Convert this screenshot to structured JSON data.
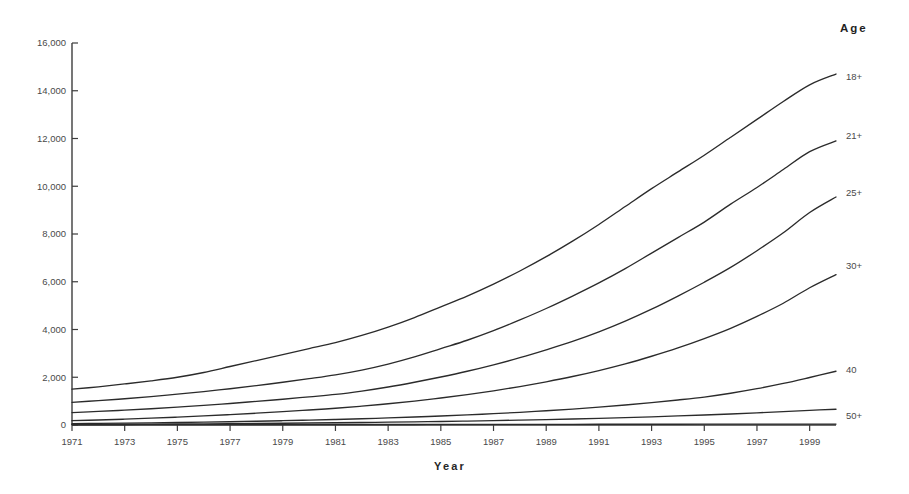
{
  "chart_data": {
    "type": "line",
    "title": "",
    "xlabel": "Year",
    "ylabel": "",
    "legend_title": "Age",
    "legend_position": "right-end-of-line",
    "grid": false,
    "xlim": [
      1971,
      2000
    ],
    "ylim": [
      0,
      16000
    ],
    "yticks": [
      0,
      2000,
      4000,
      6000,
      8000,
      10000,
      12000,
      14000,
      16000
    ],
    "ytick_labels": [
      "0",
      "2,000",
      "4,000",
      "6,000",
      "8,000",
      "10,000",
      "12,000",
      "14,000",
      "16,000"
    ],
    "xticks": [
      1971,
      1973,
      1975,
      1977,
      1979,
      1981,
      1983,
      1985,
      1987,
      1989,
      1991,
      1993,
      1995,
      1997,
      1999
    ],
    "xtick_labels": [
      "1971",
      "1973",
      "1975",
      "1977",
      "1979",
      "1981",
      "1983",
      "1985",
      "1987",
      "1989",
      "1991",
      "1993",
      "1995",
      "1997",
      "1999"
    ],
    "x": [
      1971,
      1972,
      1973,
      1974,
      1975,
      1976,
      1977,
      1978,
      1979,
      1980,
      1981,
      1982,
      1983,
      1984,
      1985,
      1986,
      1987,
      1988,
      1989,
      1990,
      1991,
      1992,
      1993,
      1994,
      1995,
      1996,
      1997,
      1998,
      1999,
      2000
    ],
    "series": [
      {
        "name": "18+",
        "label": "18+",
        "color": "#2b2b2b",
        "values": [
          1500,
          1600,
          1720,
          1850,
          2000,
          2200,
          2450,
          2700,
          2950,
          3200,
          3450,
          3750,
          4100,
          4500,
          4950,
          5400,
          5900,
          6450,
          7050,
          7700,
          8400,
          9150,
          9900,
          10600,
          11300,
          12050,
          12800,
          13550,
          14250,
          14700
        ]
      },
      {
        "name": "21+",
        "label": "21+",
        "color": "#2b2b2b",
        "values": [
          950,
          1020,
          1100,
          1190,
          1290,
          1400,
          1520,
          1650,
          1790,
          1940,
          2100,
          2300,
          2550,
          2850,
          3200,
          3550,
          3950,
          4400,
          4880,
          5400,
          5950,
          6550,
          7200,
          7850,
          8500,
          9250,
          9950,
          10700,
          11450,
          11900
        ]
      },
      {
        "name": "25+",
        "label": "25+",
        "color": "#2b2b2b",
        "values": [
          520,
          570,
          620,
          680,
          750,
          820,
          900,
          990,
          1080,
          1180,
          1280,
          1420,
          1590,
          1790,
          2010,
          2250,
          2520,
          2820,
          3150,
          3500,
          3900,
          4350,
          4850,
          5400,
          5980,
          6600,
          7300,
          8050,
          8900,
          9550
        ]
      },
      {
        "name": "30+",
        "label": "30+",
        "color": "#2b2b2b",
        "values": [
          180,
          210,
          245,
          285,
          330,
          380,
          435,
          495,
          560,
          630,
          700,
          790,
          890,
          1000,
          1130,
          1270,
          1430,
          1610,
          1810,
          2030,
          2280,
          2560,
          2880,
          3230,
          3620,
          4050,
          4550,
          5100,
          5750,
          6300
        ]
      },
      {
        "name": "40",
        "label": "40",
        "color": "#2b2b2b",
        "values": [
          60,
          68,
          78,
          90,
          104,
          120,
          138,
          158,
          180,
          205,
          232,
          262,
          296,
          334,
          376,
          422,
          474,
          532,
          596,
          668,
          748,
          838,
          938,
          1048,
          1170,
          1330,
          1520,
          1740,
          1990,
          2250
        ]
      },
      {
        "name": "50+",
        "label": "50+",
        "color": "#2b2b2b",
        "values": [
          25,
          28,
          32,
          37,
          42,
          48,
          55,
          63,
          72,
          82,
          93,
          105,
          118,
          132,
          148,
          165,
          184,
          205,
          228,
          253,
          280,
          310,
          343,
          379,
          418,
          461,
          508,
          559,
          614,
          660
        ]
      },
      {
        "name": "baseline",
        "label": "",
        "color": "#2b2b2b",
        "values": [
          10,
          11,
          12,
          13,
          14,
          15,
          16,
          17,
          18,
          19,
          20,
          21,
          22,
          23,
          24,
          25,
          26,
          27,
          28,
          29,
          30,
          31,
          32,
          33,
          34,
          35,
          36,
          37,
          38,
          39
        ]
      }
    ],
    "legend_entries": [
      {
        "label": "18+",
        "y_pixel": 80
      },
      {
        "label": "21+",
        "y_pixel": 139
      },
      {
        "label": "25+",
        "y_pixel": 196
      },
      {
        "label": "30+",
        "y_pixel": 269
      },
      {
        "label": "40",
        "y_pixel": 373
      },
      {
        "label": "50+",
        "y_pixel": 419
      }
    ]
  },
  "axes": {
    "x_title": "Year",
    "legend_title": "Age"
  }
}
